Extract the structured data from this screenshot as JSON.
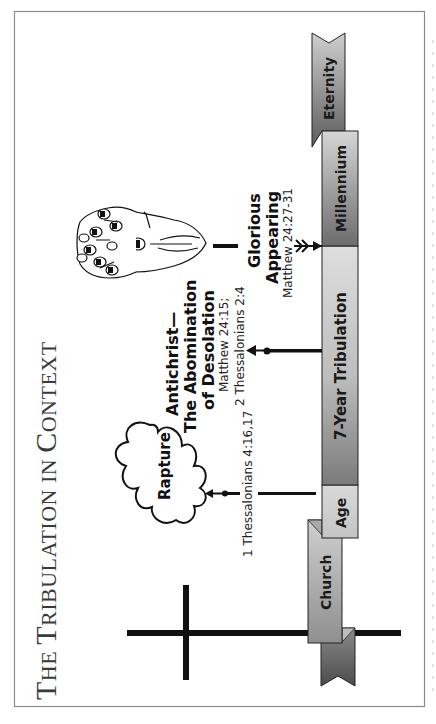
{
  "title": {
    "line": "The Tribulation in Context",
    "cap1": "T",
    "rest1": "HE ",
    "cap2": "T",
    "rest2": "RIBULATION IN ",
    "cap3": "C",
    "rest3": "ONTEXT"
  },
  "timeline": {
    "segments": [
      {
        "id": "church",
        "label": "Church"
      },
      {
        "id": "age",
        "label": "Age"
      },
      {
        "id": "tribulation",
        "label": "7-Year Tribulation"
      },
      {
        "id": "millennium",
        "label": "Millennium"
      },
      {
        "id": "eternity",
        "label": "Eternity"
      }
    ]
  },
  "events": {
    "rapture": {
      "label": "Rapture",
      "reference": "1 Thessalonians 4:16,17"
    },
    "antichrist": {
      "line1": "Antichrist—",
      "line2": "The Abomination",
      "line3": "of Desolation",
      "ref1": "Matthew 24:15;",
      "ref2": "2 Thessalonians 2:4"
    },
    "glorious_appearing": {
      "line1": "Glorious",
      "line2": "Appearing",
      "reference": "Matthew 24:27-31"
    }
  },
  "colors": {
    "bar_light": "#d9d9d9",
    "bar_dark": "#6e6e6e",
    "ink": "#111111",
    "frame": "#8a8a8a"
  }
}
